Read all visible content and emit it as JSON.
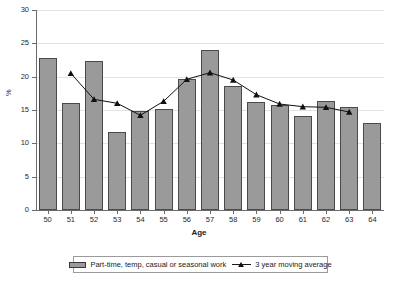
{
  "chart_data": {
    "type": "bar",
    "title": "",
    "xlabel": "Age",
    "ylabel": "%",
    "ylim": [
      0,
      30
    ],
    "yticks": [
      0,
      5,
      10,
      15,
      20,
      25,
      30
    ],
    "grid": "horizontal-faint",
    "legend_position": "bottom-center-boxed",
    "categories": [
      "50",
      "51",
      "52",
      "53",
      "54",
      "55",
      "56",
      "57",
      "58",
      "59",
      "60",
      "61",
      "62",
      "63",
      "64"
    ],
    "series": [
      {
        "name": "Part-time, temp, casual or seasonal work",
        "type": "bar",
        "color": "#9a9a9a",
        "values": [
          22.8,
          16.0,
          22.4,
          11.7,
          14.8,
          15.2,
          19.6,
          24.0,
          18.6,
          16.2,
          15.8,
          14.1,
          16.4,
          15.4,
          13.0
        ]
      },
      {
        "name": "3 year moving average",
        "type": "line",
        "color": "#111111",
        "marker": "triangle",
        "values": [
          null,
          20.5,
          16.6,
          16.0,
          14.2,
          16.3,
          19.6,
          20.6,
          19.5,
          17.3,
          15.9,
          15.5,
          15.4,
          14.7,
          null
        ]
      }
    ]
  },
  "legend": {
    "items": [
      {
        "label": "Part-time, temp, casual or seasonal work",
        "swatch": "bar-swatch"
      },
      {
        "label": "3 year moving average",
        "swatch": "line-marker-swatch"
      }
    ]
  },
  "caption": {
    "text": ""
  }
}
